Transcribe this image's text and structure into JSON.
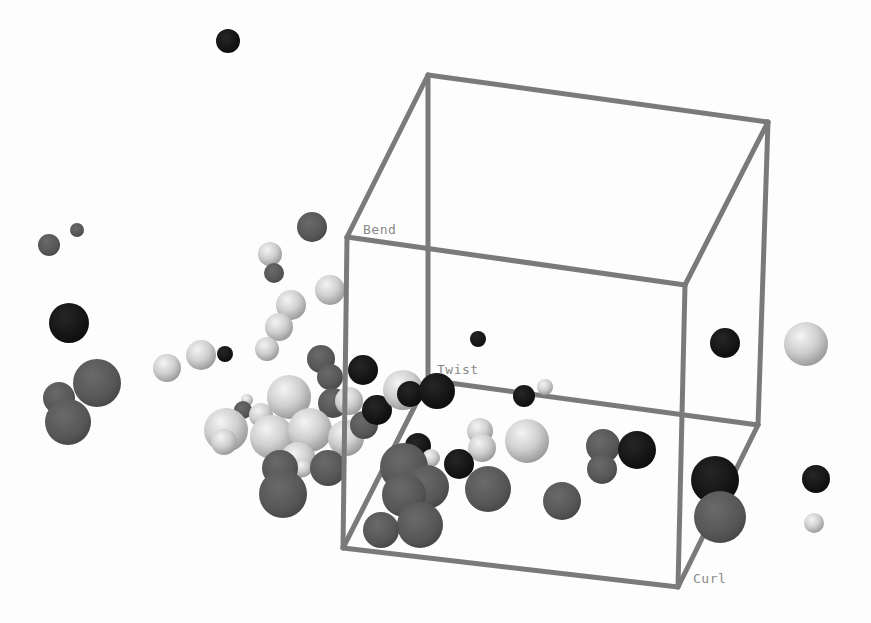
{
  "chart_data": {
    "type": "scatter",
    "subtype": "3d-scatter-spheres",
    "title": "",
    "axes": {
      "x": "Curl",
      "y": "Bend",
      "z": "Twist"
    },
    "grid": false,
    "legend": null,
    "colors": {
      "light": "#d6d6d6",
      "mid": "#5a5a5a",
      "dark": "#141414",
      "frame": "#7a7a7a",
      "background": "#fdfdfd"
    },
    "frame": {
      "vertices": {
        "ftl": [
          347,
          237
        ],
        "ftr": [
          685,
          285
        ],
        "fbl": [
          343,
          548
        ],
        "fbr": [
          678,
          587
        ],
        "btl": [
          428,
          75
        ],
        "btr": [
          768,
          122
        ],
        "bbl": [
          428,
          380
        ],
        "bbr": [
          758,
          425
        ]
      },
      "edges": [
        [
          "btl",
          "btr"
        ],
        [
          "btr",
          "bbr"
        ],
        [
          "bbr",
          "bbl"
        ],
        [
          "bbl",
          "btl"
        ],
        [
          "ftl",
          "ftr"
        ],
        [
          "ftr",
          "fbr"
        ],
        [
          "fbr",
          "fbl"
        ],
        [
          "fbl",
          "ftl"
        ],
        [
          "ftl",
          "btl"
        ],
        [
          "ftr",
          "btr"
        ],
        [
          "fbl",
          "bbl"
        ],
        [
          "fbr",
          "bbr"
        ]
      ]
    },
    "labels": [
      {
        "text": "Bend",
        "x": 363,
        "y": 222
      },
      {
        "text": "Twist",
        "x": 437,
        "y": 362
      },
      {
        "text": "Curl",
        "x": 693,
        "y": 571
      }
    ],
    "points": [
      {
        "x": 228,
        "y": 41,
        "r": 12,
        "group": "dark"
      },
      {
        "x": 49,
        "y": 245,
        "r": 11,
        "group": "mid"
      },
      {
        "x": 77,
        "y": 230,
        "r": 7,
        "group": "mid"
      },
      {
        "x": 312,
        "y": 227,
        "r": 15,
        "group": "mid"
      },
      {
        "x": 270,
        "y": 254,
        "r": 12,
        "group": "light"
      },
      {
        "x": 274,
        "y": 273,
        "r": 10,
        "group": "mid"
      },
      {
        "x": 330,
        "y": 290,
        "r": 15,
        "group": "light"
      },
      {
        "x": 291,
        "y": 305,
        "r": 15,
        "group": "light"
      },
      {
        "x": 279,
        "y": 327,
        "r": 14,
        "group": "light"
      },
      {
        "x": 267,
        "y": 349,
        "r": 12,
        "group": "light"
      },
      {
        "x": 69,
        "y": 323,
        "r": 20,
        "group": "dark"
      },
      {
        "x": 201,
        "y": 355,
        "r": 15,
        "group": "light"
      },
      {
        "x": 225,
        "y": 354,
        "r": 8,
        "group": "dark"
      },
      {
        "x": 167,
        "y": 368,
        "r": 14,
        "group": "light"
      },
      {
        "x": 97,
        "y": 383,
        "r": 24,
        "group": "mid"
      },
      {
        "x": 59,
        "y": 398,
        "r": 16,
        "group": "mid"
      },
      {
        "x": 68,
        "y": 422,
        "r": 23,
        "group": "mid"
      },
      {
        "x": 321,
        "y": 359,
        "r": 14,
        "group": "mid"
      },
      {
        "x": 363,
        "y": 370,
        "r": 15,
        "group": "dark"
      },
      {
        "x": 330,
        "y": 377,
        "r": 13,
        "group": "mid"
      },
      {
        "x": 289,
        "y": 397,
        "r": 22,
        "group": "light"
      },
      {
        "x": 247,
        "y": 400,
        "r": 6,
        "group": "light"
      },
      {
        "x": 243,
        "y": 410,
        "r": 9,
        "group": "mid"
      },
      {
        "x": 261,
        "y": 415,
        "r": 12,
        "group": "light"
      },
      {
        "x": 333,
        "y": 403,
        "r": 15,
        "group": "mid"
      },
      {
        "x": 349,
        "y": 401,
        "r": 14,
        "group": "light"
      },
      {
        "x": 226,
        "y": 430,
        "r": 22,
        "group": "light"
      },
      {
        "x": 224,
        "y": 442,
        "r": 13,
        "group": "light"
      },
      {
        "x": 272,
        "y": 437,
        "r": 22,
        "group": "light"
      },
      {
        "x": 310,
        "y": 430,
        "r": 22,
        "group": "light"
      },
      {
        "x": 346,
        "y": 438,
        "r": 18,
        "group": "light"
      },
      {
        "x": 364,
        "y": 425,
        "r": 14,
        "group": "mid"
      },
      {
        "x": 377,
        "y": 410,
        "r": 15,
        "group": "dark"
      },
      {
        "x": 403,
        "y": 390,
        "r": 20,
        "group": "light"
      },
      {
        "x": 410,
        "y": 394,
        "r": 13,
        "group": "dark"
      },
      {
        "x": 437,
        "y": 391,
        "r": 18,
        "group": "dark"
      },
      {
        "x": 298,
        "y": 460,
        "r": 18,
        "group": "light"
      },
      {
        "x": 303,
        "y": 468,
        "r": 9,
        "group": "light"
      },
      {
        "x": 280,
        "y": 468,
        "r": 18,
        "group": "mid"
      },
      {
        "x": 328,
        "y": 468,
        "r": 18,
        "group": "mid"
      },
      {
        "x": 283,
        "y": 494,
        "r": 24,
        "group": "mid"
      },
      {
        "x": 478,
        "y": 339,
        "r": 8,
        "group": "dark"
      },
      {
        "x": 524,
        "y": 396,
        "r": 11,
        "group": "dark"
      },
      {
        "x": 545,
        "y": 387,
        "r": 8,
        "group": "light"
      },
      {
        "x": 418,
        "y": 446,
        "r": 13,
        "group": "dark"
      },
      {
        "x": 431,
        "y": 458,
        "r": 9,
        "group": "light"
      },
      {
        "x": 480,
        "y": 431,
        "r": 13,
        "group": "light"
      },
      {
        "x": 482,
        "y": 448,
        "r": 14,
        "group": "light"
      },
      {
        "x": 459,
        "y": 464,
        "r": 15,
        "group": "dark"
      },
      {
        "x": 527,
        "y": 441,
        "r": 22,
        "group": "light"
      },
      {
        "x": 404,
        "y": 467,
        "r": 24,
        "group": "mid"
      },
      {
        "x": 427,
        "y": 487,
        "r": 22,
        "group": "mid"
      },
      {
        "x": 404,
        "y": 495,
        "r": 22,
        "group": "mid"
      },
      {
        "x": 488,
        "y": 489,
        "r": 23,
        "group": "mid"
      },
      {
        "x": 420,
        "y": 525,
        "r": 23,
        "group": "mid"
      },
      {
        "x": 381,
        "y": 530,
        "r": 18,
        "group": "mid"
      },
      {
        "x": 562,
        "y": 501,
        "r": 19,
        "group": "mid"
      },
      {
        "x": 603,
        "y": 446,
        "r": 17,
        "group": "mid"
      },
      {
        "x": 602,
        "y": 469,
        "r": 15,
        "group": "mid"
      },
      {
        "x": 637,
        "y": 450,
        "r": 19,
        "group": "dark"
      },
      {
        "x": 725,
        "y": 343,
        "r": 15,
        "group": "dark"
      },
      {
        "x": 806,
        "y": 344,
        "r": 22,
        "group": "light"
      },
      {
        "x": 715,
        "y": 480,
        "r": 24,
        "group": "dark"
      },
      {
        "x": 720,
        "y": 517,
        "r": 26,
        "group": "mid"
      },
      {
        "x": 816,
        "y": 479,
        "r": 14,
        "group": "dark"
      },
      {
        "x": 814,
        "y": 523,
        "r": 10,
        "group": "light"
      }
    ]
  }
}
